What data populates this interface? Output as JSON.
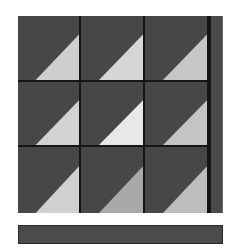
{
  "puzzle": {
    "rows": 3,
    "cols": 3,
    "tile_base_color": "#474747",
    "divider_color": "#151515",
    "tiles": [
      {
        "row": 0,
        "col": 0,
        "icon": "triangle-lower-right",
        "triangle_color": "#cfcfcf"
      },
      {
        "row": 0,
        "col": 1,
        "icon": "triangle-lower-right",
        "triangle_color": "#d6d6d6"
      },
      {
        "row": 0,
        "col": 2,
        "icon": "triangle-lower-right",
        "triangle_color": "#c6c6c6"
      },
      {
        "row": 1,
        "col": 0,
        "icon": "triangle-lower-right",
        "triangle_color": "#d2d2d2"
      },
      {
        "row": 1,
        "col": 1,
        "icon": "triangle-lower-right",
        "triangle_color": "#e8e8e8"
      },
      {
        "row": 1,
        "col": 2,
        "icon": "triangle-lower-right",
        "triangle_color": "#c4c4c4"
      },
      {
        "row": 2,
        "col": 0,
        "icon": "triangle-lower-right",
        "triangle_color": "#d0d0d0"
      },
      {
        "row": 2,
        "col": 1,
        "icon": "triangle-lower-right",
        "triangle_color": "#a9a9a9"
      },
      {
        "row": 2,
        "col": 2,
        "icon": "triangle-lower-right",
        "triangle_color": "#bdbdbd"
      }
    ]
  },
  "side_strip": {
    "color": "#4a4a4a"
  },
  "bottom_bar": {
    "color": "#4b4b4b"
  }
}
